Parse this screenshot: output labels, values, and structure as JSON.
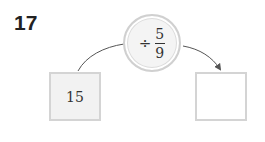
{
  "problem": {
    "number": "17",
    "operation": {
      "operator": "÷",
      "fraction": {
        "numerator": "5",
        "denominator": "9"
      }
    },
    "input_box": {
      "value": "15"
    },
    "output_box": {
      "value": ""
    }
  },
  "colors": {
    "text": "#222222",
    "border": "#d4d4d4",
    "input_fill": "#f2f2f2",
    "circle_fill": "#f4f4f4",
    "arrow": "#555555"
  }
}
